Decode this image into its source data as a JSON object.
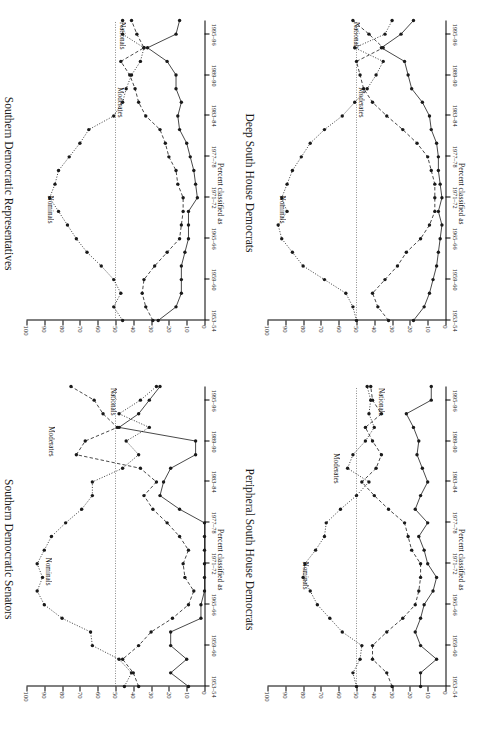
{
  "figure": {
    "axis_title": "Percent classified as",
    "series_labels": {
      "nominals": "Nominals",
      "moderates": "Moderates",
      "nationals": "Nationals"
    },
    "y_ticks": [
      "0",
      "10",
      "20",
      "30",
      "40",
      "50",
      "60",
      "70",
      "80",
      "90",
      "100"
    ],
    "x_ticks": [
      "1953–54",
      "1959–60",
      "1965–66",
      "1971–72",
      "1977–78",
      "1983–84",
      "1989–90",
      "1995–96"
    ],
    "colors": {
      "ink": "#1a1a1a",
      "refline": "#4a4a4a",
      "paper": "#ffffff"
    }
  },
  "chart_data": [
    {
      "id": "southern-democratic-representatives",
      "type": "line",
      "title": "Southern Democratic Representatives",
      "xlabel": "",
      "ylabel": "Percent classified as",
      "ylim": [
        0,
        100
      ],
      "grid": false,
      "refline_y": 50,
      "legend": "inline-annotations",
      "x": [
        "1953–54",
        "1955–56",
        "1957–58",
        "1959–60",
        "1961–62",
        "1963–64",
        "1965–66",
        "1967–68",
        "1969–70",
        "1971–72",
        "1973–74",
        "1975–76",
        "1977–78",
        "1979–80",
        "1981–82",
        "1983–84",
        "1985–86",
        "1987–88",
        "1989–90",
        "1991–92",
        "1993–94",
        "1995–96",
        "1997–98"
      ],
      "series": [
        {
          "name": "Nominals",
          "style": "dotted",
          "values": [
            46,
            51,
            47,
            51,
            58,
            66,
            72,
            77,
            82,
            87,
            84,
            82,
            76,
            70,
            65,
            51,
            46,
            44,
            41,
            36,
            34,
            46,
            46
          ]
        },
        {
          "name": "Moderates",
          "style": "dashed",
          "values": [
            29,
            33,
            35,
            34,
            28,
            21,
            14,
            13,
            12,
            12,
            15,
            16,
            20,
            22,
            25,
            33,
            37,
            39,
            42,
            47,
            34,
            38,
            41
          ]
        },
        {
          "name": "Nationals",
          "style": "solid",
          "values": [
            26,
            16,
            13,
            13,
            13,
            11,
            9,
            9,
            9,
            4,
            5,
            6,
            8,
            10,
            14,
            15,
            13,
            16,
            16,
            21,
            32,
            16,
            14
          ]
        }
      ]
    },
    {
      "id": "deep-south-house-democrats",
      "type": "line",
      "title": "Deep South House Democrats",
      "xlabel": "",
      "ylabel": "Percent classified as",
      "ylim": [
        0,
        100
      ],
      "grid": false,
      "refline_y": 50,
      "legend": "inline-annotations",
      "x": [
        "1953–54",
        "1955–56",
        "1957–58",
        "1959–60",
        "1961–62",
        "1963–64",
        "1965–66",
        "1967–68",
        "1969–70",
        "1971–72",
        "1973–74",
        "1975–76",
        "1977–78",
        "1979–80",
        "1981–82",
        "1983–84",
        "1985–86",
        "1987–88",
        "1989–90",
        "1991–92",
        "1993–94",
        "1995–96",
        "1997–98"
      ],
      "series": [
        {
          "name": "Nominals",
          "style": "dotted",
          "values": [
            50,
            52,
            56,
            68,
            80,
            86,
            92,
            94,
            89,
            92,
            89,
            86,
            81,
            76,
            68,
            58,
            51,
            44,
            39,
            35,
            51,
            34,
            30
          ]
        },
        {
          "name": "Moderates",
          "style": "dashed",
          "values": [
            32,
            38,
            41,
            34,
            27,
            22,
            14,
            9,
            6,
            6,
            6,
            8,
            10,
            16,
            24,
            33,
            41,
            46,
            48,
            50,
            35,
            43,
            52
          ]
        },
        {
          "name": "Nationals",
          "style": "solid",
          "values": [
            18,
            12,
            9,
            7,
            5,
            4,
            3,
            2,
            4,
            2,
            3,
            4,
            4,
            5,
            8,
            9,
            13,
            19,
            21,
            23,
            36,
            25,
            18
          ]
        }
      ]
    },
    {
      "id": "southern-democratic-senators",
      "type": "line",
      "title": "Southern Democratic Senators",
      "xlabel": "",
      "ylabel": "Percent classified as",
      "ylim": [
        0,
        100
      ],
      "grid": false,
      "refline_y": 50,
      "legend": "inline-annotations",
      "x": [
        "1953–54",
        "1955–56",
        "1957–58",
        "1959–60",
        "1961–62",
        "1963–64",
        "1965–66",
        "1967–68",
        "1969–70",
        "1971–72",
        "1973–74",
        "1975–76",
        "1977–78",
        "1979–80",
        "1981–82",
        "1983–84",
        "1985–86",
        "1987–88",
        "1989–90",
        "1991–92",
        "1993–94",
        "1995–96",
        "1997–98"
      ],
      "series": [
        {
          "name": "Nominals",
          "style": "dotted",
          "values": [
            45,
            41,
            48,
            63,
            64,
            80,
            90,
            94,
            91,
            94,
            90,
            86,
            78,
            69,
            63,
            63,
            46,
            37,
            44,
            31,
            48,
            36,
            27
          ]
        },
        {
          "name": "Moderates",
          "style": "dashed",
          "values": [
            37,
            40,
            46,
            37,
            30,
            18,
            9,
            6,
            11,
            12,
            9,
            14,
            21,
            29,
            34,
            27,
            36,
            72,
            67,
            49,
            57,
            62,
            75
          ]
        },
        {
          "name": "Nationals",
          "style": "solid",
          "values": [
            9,
            19,
            10,
            19,
            19,
            2,
            2,
            0,
            0,
            0,
            0,
            0,
            0,
            14,
            25,
            23,
            19,
            5,
            5,
            48,
            37,
            31,
            25
          ]
        }
      ]
    },
    {
      "id": "peripheral-south-house-democrats",
      "type": "line",
      "title": "Peripheral South House Democrats",
      "xlabel": "",
      "ylabel": "Percent classified as",
      "ylim": [
        0,
        100
      ],
      "grid": false,
      "refline_y": 50,
      "legend": "inline-annotations",
      "x": [
        "1953–54",
        "1955–56",
        "1957–58",
        "1959–60",
        "1961–62",
        "1963–64",
        "1965–66",
        "1967–68",
        "1969–70",
        "1971–72",
        "1973–74",
        "1975–76",
        "1977–78",
        "1979–80",
        "1981–82",
        "1983–84",
        "1985–86",
        "1987–88",
        "1989–90",
        "1991–92",
        "1993–94",
        "1995–96",
        "1997–98"
      ],
      "series": [
        {
          "name": "Nominals",
          "style": "dotted",
          "values": [
            50,
            52,
            48,
            47,
            58,
            65,
            72,
            76,
            80,
            79,
            73,
            68,
            67,
            59,
            50,
            43,
            55,
            52,
            45,
            40,
            43,
            42,
            44
          ]
        },
        {
          "name": "Moderates",
          "style": "dashed",
          "values": [
            30,
            33,
            41,
            41,
            33,
            24,
            17,
            15,
            14,
            14,
            19,
            21,
            23,
            32,
            40,
            47,
            39,
            36,
            41,
            45,
            36,
            41,
            42
          ]
        },
        {
          "name": "Nationals",
          "style": "solid",
          "values": [
            14,
            14,
            5,
            14,
            17,
            14,
            12,
            7,
            5,
            10,
            12,
            15,
            10,
            17,
            14,
            10,
            13,
            16,
            15,
            18,
            22,
            8,
            8
          ]
        }
      ]
    }
  ]
}
